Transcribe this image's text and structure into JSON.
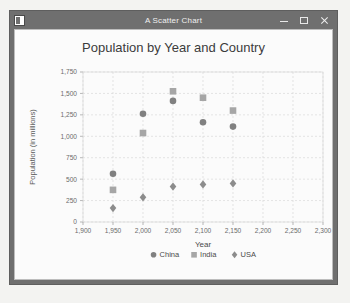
{
  "window": {
    "title": "A Scatter Chart",
    "icon": "app-icon",
    "buttons": {
      "minimize": "minimize-button",
      "maximize": "maximize-button",
      "close": "close-button"
    }
  },
  "chart_data": {
    "type": "scatter",
    "title": "Population by Year and Country",
    "xlabel": "Year",
    "ylabel": "Population (in millions)",
    "xlim": [
      1900,
      2300
    ],
    "ylim": [
      0,
      1750
    ],
    "xticks": [
      "1,900",
      "1,950",
      "2,000",
      "2,050",
      "2,100",
      "2,150",
      "2,200",
      "2,250",
      "2,300"
    ],
    "xtick_values": [
      1900,
      1950,
      2000,
      2050,
      2100,
      2150,
      2200,
      2250,
      2300
    ],
    "yticks": [
      "0",
      "250",
      "500",
      "750",
      "1,000",
      "1,250",
      "1,500",
      "1,750"
    ],
    "ytick_values": [
      0,
      250,
      500,
      750,
      1000,
      1250,
      1500,
      1750
    ],
    "grid": true,
    "legend_position": "bottom",
    "series": [
      {
        "name": "China",
        "marker": "circle",
        "color": "#808080",
        "x": [
          1950,
          2000,
          2050,
          2100,
          2150
        ],
        "y": [
          563,
          1263,
          1413,
          1163,
          1113
        ]
      },
      {
        "name": "India",
        "marker": "square",
        "color": "#a6a6a6",
        "x": [
          1950,
          2000,
          2050,
          2100,
          2150
        ],
        "y": [
          375,
          1038,
          1525,
          1450,
          1300
        ]
      },
      {
        "name": "USA",
        "marker": "diamond",
        "color": "#8c8c8c",
        "x": [
          1950,
          2000,
          2050,
          2100,
          2150
        ],
        "y": [
          163,
          288,
          413,
          438,
          450
        ]
      }
    ]
  },
  "colors": {
    "titlebar": "#6f6f6f",
    "plot_bg": "#fbfbfb",
    "grid": "#d8d8d8",
    "axis": "#9a9a9a"
  }
}
